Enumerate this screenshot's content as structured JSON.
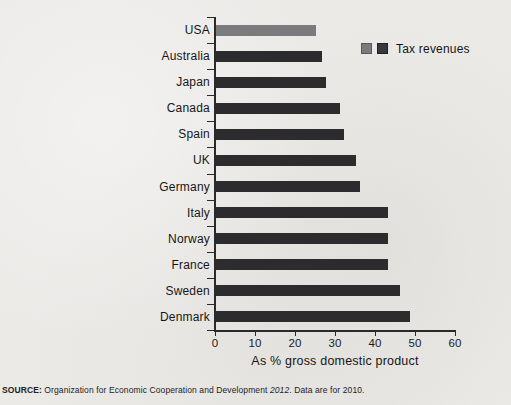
{
  "page": {
    "background_color": "#ebeae7"
  },
  "legend": {
    "label": "Tax revenues",
    "swatches": [
      {
        "name": "highlight-swatch",
        "color": "#7b7b7d",
        "border": "#5a5a5c"
      },
      {
        "name": "default-swatch",
        "color": "#39393b",
        "border": "#202022"
      }
    ]
  },
  "source_note": {
    "prefix": "SOURCE:",
    "body": " Organization for Economic Cooperation and Development ",
    "italic": "2012",
    "suffix": ". Data are for 2010."
  },
  "chart_data": {
    "type": "bar",
    "orientation": "horizontal",
    "title": "",
    "xlabel": "As % gross domestic product",
    "ylabel": "",
    "xlim": [
      0,
      60
    ],
    "xticks": [
      0,
      10,
      20,
      30,
      40,
      50,
      60
    ],
    "grid": false,
    "legend_position": "top-right",
    "series_name": "Tax revenues",
    "categories": [
      "USA",
      "Australia",
      "Japan",
      "Canada",
      "Spain",
      "UK",
      "Germany",
      "Italy",
      "Norway",
      "France",
      "Sweden",
      "Denmark"
    ],
    "values": [
      25,
      26.5,
      27.5,
      31,
      32,
      35,
      36,
      43,
      43,
      43,
      46,
      48.5
    ],
    "bar_color": "#2c2c2e",
    "highlight_index": 0,
    "highlight_color": "#7b7b7d"
  }
}
